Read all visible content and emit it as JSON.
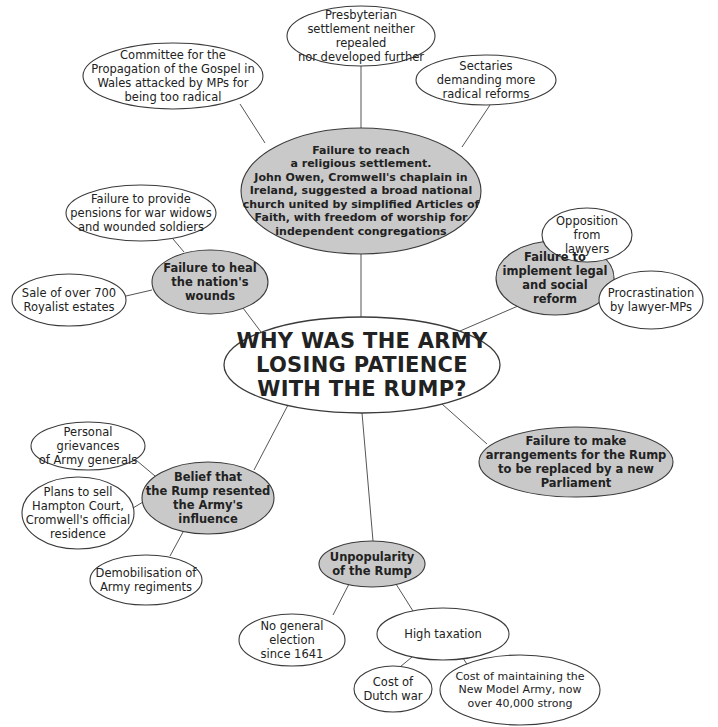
{
  "diagram": {
    "title": "WHY WAS THE ARMY\nLOSING PATIENCE\nWITH THE RUMP?",
    "colors": {
      "shaded_fill": "#c9c9c9",
      "plain_fill": "#ffffff",
      "stroke": "#3a3a3a",
      "text": "#222222"
    },
    "nodes": [
      {
        "id": "central",
        "type": "central",
        "cx": 362,
        "cy": 365,
        "rx": 138,
        "ry": 48,
        "label": "WHY WAS THE ARMY\nLOSING PATIENCE\nWITH THE RUMP?"
      },
      {
        "id": "religious",
        "type": "shaded",
        "cx": 361,
        "cy": 191,
        "rx": 120,
        "ry": 63,
        "label": "Failure to reach\na religious settlement.\nJohn Owen, Cromwell's chaplain in\nIreland, suggested a broad national\nchurch united by simplified Articles of\nFaith, with freedom of worship for\nindependent congregations"
      },
      {
        "id": "presbyterian",
        "type": "plain",
        "cx": 361,
        "cy": 36,
        "rx": 74,
        "ry": 30,
        "label": "Presbyterian\nsettlement neither repealed\nnor developed further"
      },
      {
        "id": "committee",
        "type": "plain",
        "cx": 173,
        "cy": 76,
        "rx": 90,
        "ry": 33,
        "label": "Committee for the\nPropagation of the Gospel in\nWales attacked by MPs for\nbeing too radical"
      },
      {
        "id": "sectaries",
        "type": "plain",
        "cx": 486,
        "cy": 80,
        "rx": 70,
        "ry": 25,
        "label": "Sectaries\ndemanding more\nradical reforms"
      },
      {
        "id": "heal",
        "type": "shaded",
        "cx": 210,
        "cy": 282,
        "rx": 58,
        "ry": 32,
        "label": "Failure to heal\nthe nation's\nwounds"
      },
      {
        "id": "pensions",
        "type": "plain",
        "cx": 141,
        "cy": 213,
        "rx": 75,
        "ry": 28,
        "label": "Failure to provide\npensions for war widows\nand wounded soldiers"
      },
      {
        "id": "sale",
        "type": "plain",
        "cx": 69,
        "cy": 300,
        "rx": 57,
        "ry": 26,
        "label": "Sale of over 700\nRoyalist estates"
      },
      {
        "id": "legal",
        "type": "shaded",
        "cx": 555,
        "cy": 278,
        "rx": 59,
        "ry": 37,
        "label": "Failure to\nimplement legal\nand social\nreform"
      },
      {
        "id": "opposition",
        "type": "plain",
        "cx": 587,
        "cy": 235,
        "rx": 45,
        "ry": 27,
        "label": "Opposition from\nlawyers"
      },
      {
        "id": "procrastination",
        "type": "plain",
        "cx": 651,
        "cy": 300,
        "rx": 52,
        "ry": 29,
        "label": "Procrastination\nby lawyer-MPs"
      },
      {
        "id": "belief",
        "type": "shaded",
        "cx": 208,
        "cy": 498,
        "rx": 66,
        "ry": 36,
        "label": "Belief that\nthe Rump resented\nthe Army's\ninfluence"
      },
      {
        "id": "personal",
        "type": "plain",
        "cx": 88,
        "cy": 446,
        "rx": 57,
        "ry": 24,
        "label": "Personal grievances\nof Army generals"
      },
      {
        "id": "plans",
        "type": "plain",
        "cx": 78,
        "cy": 513,
        "rx": 56,
        "ry": 36,
        "label": "Plans to sell\nHampton Court,\nCromwell's official\nresidence"
      },
      {
        "id": "demobilisation",
        "type": "plain",
        "cx": 146,
        "cy": 580,
        "rx": 56,
        "ry": 25,
        "label": "Demobilisation of\nArmy regiments"
      },
      {
        "id": "arrangements",
        "type": "shaded",
        "cx": 576,
        "cy": 462,
        "rx": 97,
        "ry": 35,
        "label": "Failure to make\narrangements for the Rump\nto be replaced by a new\nParliament"
      },
      {
        "id": "unpopularity",
        "type": "shaded",
        "cx": 372,
        "cy": 564,
        "rx": 53,
        "ry": 23,
        "label": "Unpopularity\nof the Rump"
      },
      {
        "id": "no-election",
        "type": "plain",
        "cx": 292,
        "cy": 640,
        "rx": 53,
        "ry": 26,
        "label": "No general election\nsince 1641"
      },
      {
        "id": "high-taxation",
        "type": "plain",
        "cx": 443,
        "cy": 634,
        "rx": 66,
        "ry": 26,
        "label": "High taxation"
      },
      {
        "id": "dutch-war",
        "type": "plain",
        "cx": 393,
        "cy": 689,
        "rx": 39,
        "ry": 23,
        "label": "Cost of\nDutch war"
      },
      {
        "id": "model-army",
        "type": "plain",
        "cx": 520,
        "cy": 690,
        "rx": 80,
        "ry": 35,
        "label": "Cost of maintaining the\nNew Model Army, now\nover 40,000 strong"
      }
    ],
    "edges": [
      {
        "from": "central",
        "to": "religious",
        "x1": 361,
        "y1": 317,
        "x2": 361,
        "y2": 254
      },
      {
        "from": "religious",
        "to": "presbyterian",
        "x1": 361,
        "y1": 128,
        "x2": 361,
        "y2": 66
      },
      {
        "from": "religious",
        "to": "committee",
        "x1": 265,
        "y1": 143,
        "x2": 240,
        "y2": 104
      },
      {
        "from": "religious",
        "to": "sectaries",
        "x1": 462,
        "y1": 147,
        "x2": 490,
        "y2": 105
      },
      {
        "from": "central",
        "to": "heal",
        "x1": 261,
        "y1": 332,
        "x2": 243,
        "y2": 308
      },
      {
        "from": "heal",
        "to": "pensions",
        "x1": 184,
        "y1": 252,
        "x2": 173,
        "y2": 239
      },
      {
        "from": "heal",
        "to": "sale",
        "x1": 152,
        "y1": 290,
        "x2": 126,
        "y2": 296
      },
      {
        "from": "central",
        "to": "legal",
        "x1": 460,
        "y1": 331,
        "x2": 518,
        "y2": 306
      },
      {
        "from": "legal",
        "to": "opposition",
        "x1": 568,
        "y1": 242,
        "x2": 578,
        "y2": 260
      },
      {
        "from": "legal",
        "to": "procrastination",
        "x1": 614,
        "y1": 294,
        "x2": 599,
        "y2": 294
      },
      {
        "from": "central",
        "to": "belief",
        "x1": 288,
        "y1": 405,
        "x2": 254,
        "y2": 470
      },
      {
        "from": "belief",
        "to": "personal",
        "x1": 155,
        "y1": 476,
        "x2": 130,
        "y2": 455
      },
      {
        "from": "belief",
        "to": "plans",
        "x1": 143,
        "y1": 502,
        "x2": 133,
        "y2": 508
      },
      {
        "from": "belief",
        "to": "demobilisation",
        "x1": 183,
        "y1": 532,
        "x2": 170,
        "y2": 556
      },
      {
        "from": "central",
        "to": "arrangements",
        "x1": 442,
        "y1": 404,
        "x2": 487,
        "y2": 444
      },
      {
        "from": "central",
        "to": "unpopularity",
        "x1": 362,
        "y1": 413,
        "x2": 373,
        "y2": 541
      },
      {
        "from": "unpopularity",
        "to": "no-election",
        "x1": 349,
        "y1": 584,
        "x2": 333,
        "y2": 615
      },
      {
        "from": "unpopularity",
        "to": "high-taxation",
        "x1": 396,
        "y1": 584,
        "x2": 413,
        "y2": 611
      },
      {
        "from": "high-taxation",
        "to": "dutch-war",
        "x1": 412,
        "y1": 657,
        "x2": 400,
        "y2": 667
      },
      {
        "from": "high-taxation",
        "to": "model-army",
        "x1": 463,
        "y1": 658,
        "x2": 473,
        "y2": 674
      }
    ]
  }
}
